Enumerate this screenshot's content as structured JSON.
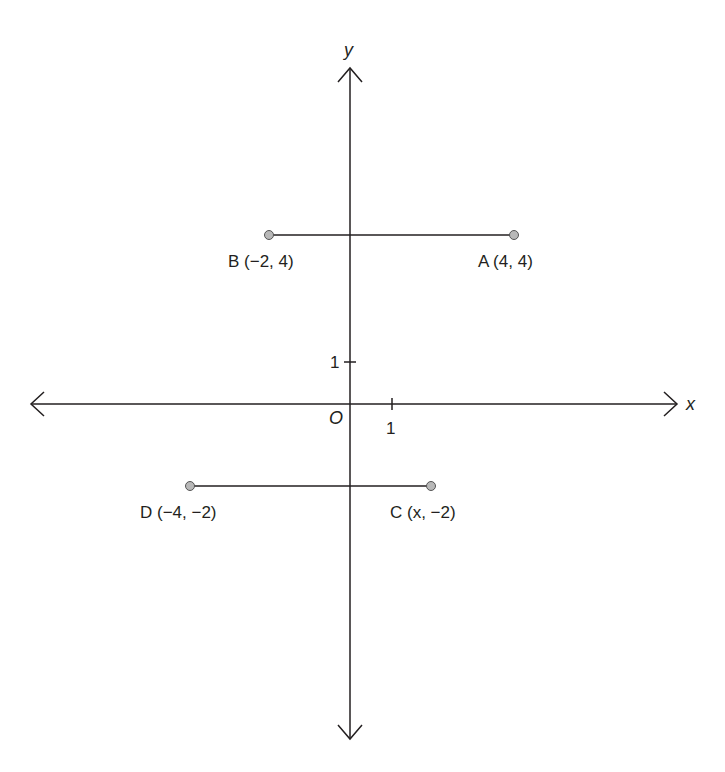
{
  "diagram": {
    "type": "coordinate-plane",
    "axes": {
      "x_label": "x",
      "y_label": "y",
      "origin_label": "O",
      "x_tick_label": "1",
      "y_tick_label": "1"
    },
    "points": [
      {
        "name": "A",
        "label": "A (4, 4)",
        "x": 4,
        "y": 4
      },
      {
        "name": "B",
        "label": "B (−2, 4)",
        "x": -2,
        "y": 4
      },
      {
        "name": "C",
        "label": "C (x, −2)",
        "x": "x",
        "y": -2
      },
      {
        "name": "D",
        "label": "D (−4, −2)",
        "x": -4,
        "y": -2
      }
    ],
    "segments": [
      {
        "from": "B",
        "to": "A"
      },
      {
        "from": "D",
        "to": "C"
      }
    ],
    "colors": {
      "line": "#231f20",
      "point_fill": "#b8b8b8"
    }
  }
}
